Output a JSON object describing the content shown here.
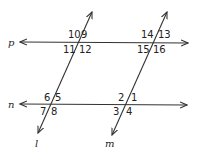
{
  "diagram": {
    "type": "parallel lines cut by two transversals",
    "lines": {
      "p": {
        "label": "p"
      },
      "n": {
        "label": "n"
      },
      "l": {
        "label": "l"
      },
      "m": {
        "label": "m"
      }
    },
    "angles": {
      "a1": "1",
      "a2": "2",
      "a3": "3",
      "a4": "4",
      "a5": "5",
      "a6": "6",
      "a7": "7",
      "a8": "8",
      "a9": "9",
      "a10": "10",
      "a11": "11",
      "a12": "12",
      "a13": "13",
      "a14": "14",
      "a15": "15",
      "a16": "16"
    },
    "colors": {
      "stroke": "#333333",
      "text": "#222222",
      "background": "#ffffff"
    }
  }
}
